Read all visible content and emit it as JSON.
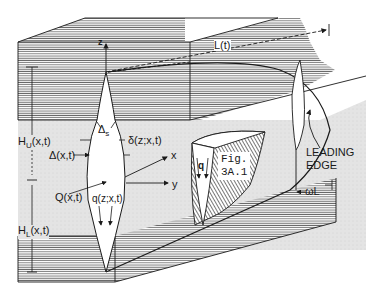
{
  "figure": {
    "id_line1": "Fig.",
    "id_line2": "3A.1"
  },
  "labels": {
    "z_axis": "z",
    "x_axis": "x",
    "y_axis": "y",
    "length": "L(t)",
    "upper_height": "H_U(x,t)",
    "upper_height_main": "H",
    "upper_height_sub": "U",
    "upper_height_args": "(x,t)",
    "lower_height_main": "H",
    "lower_height_sub": "L",
    "lower_height_args": "(x,t)",
    "delta_s_main": "Δ",
    "delta_s_sub": "s",
    "width_upper": "δ(z;x,t)",
    "width_max": "Δ(x,t)",
    "flow_total": "Q(x,t)",
    "flow_local": "q(z;x,t)",
    "flow_q": "q",
    "leading_edge_line1": "LEADING",
    "leading_edge_line2": "EDGE",
    "omega_L": "ωL"
  },
  "colors": {
    "ink": "#1a1a1a",
    "hatch": "#555555",
    "middle_layer": "#e6e6e6",
    "background": "#ffffff"
  }
}
